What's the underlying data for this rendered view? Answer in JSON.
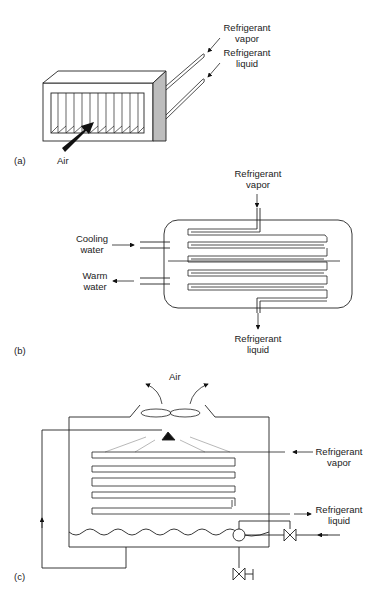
{
  "diagram": {
    "panels": [
      {
        "id": "a",
        "tag": "(a)",
        "type": "air-cooled condenser",
        "labels": {
          "vapor_line1": "Refrigerant",
          "vapor_line2": "vapor",
          "liquid_line1": "Refrigerant",
          "liquid_line2": "liquid",
          "air": "Air"
        }
      },
      {
        "id": "b",
        "tag": "(b)",
        "type": "water-cooled shell-and-tube condenser",
        "labels": {
          "vapor_line1": "Refrigerant",
          "vapor_line2": "vapor",
          "cooling_line1": "Cooling",
          "cooling_line2": "water",
          "warm_line1": "Warm",
          "warm_line2": "water",
          "liquid_line1": "Refrigerant",
          "liquid_line2": "liquid"
        }
      },
      {
        "id": "c",
        "tag": "(c)",
        "type": "evaporative condenser",
        "labels": {
          "air": "Air",
          "vapor_line1": "Refrigerant",
          "vapor_line2": "vapor",
          "liquid_line1": "Refrigerant",
          "liquid_line2": "liquid"
        }
      }
    ]
  }
}
